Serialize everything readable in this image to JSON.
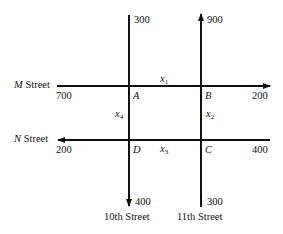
{
  "diagram": {
    "streets": {
      "m_street": {
        "name_italic": "M",
        "name_rest": " Street",
        "direction": "east"
      },
      "n_street": {
        "name_italic": "N",
        "name_rest": " Street",
        "direction": "west"
      },
      "tenth_street": {
        "name": "10th Street",
        "direction": "south"
      },
      "eleventh_street": {
        "name": "11th Street",
        "direction": "north"
      }
    },
    "intersections": {
      "A": "A",
      "B": "B",
      "C": "C",
      "D": "D"
    },
    "flows": {
      "tenth_top": "300",
      "eleventh_top": "900",
      "m_left": "700",
      "m_right": "200",
      "n_left": "200",
      "n_right": "400",
      "tenth_bottom": "400",
      "eleventh_bottom": "300"
    },
    "unknowns": {
      "x1": {
        "base": "x",
        "sub": "1"
      },
      "x2": {
        "base": "x",
        "sub": "2"
      },
      "x3": {
        "base": "x",
        "sub": "3"
      },
      "x4": {
        "base": "x",
        "sub": "4"
      }
    }
  }
}
